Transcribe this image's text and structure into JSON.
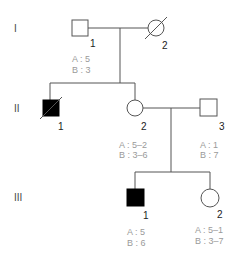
{
  "title": "",
  "generations": [
    "I",
    "II",
    "III"
  ],
  "individuals": [
    {
      "id": "I-1",
      "label": "1",
      "sex": "male",
      "affected": false,
      "deceased": false,
      "genotype": {
        "A": "A : 5",
        "B": "B : 3"
      }
    },
    {
      "id": "I-2",
      "label": "2",
      "sex": "female",
      "affected": false,
      "deceased": true,
      "genotype": null
    },
    {
      "id": "II-1",
      "label": "1",
      "sex": "male",
      "affected": true,
      "deceased": true,
      "genotype": null
    },
    {
      "id": "II-2",
      "label": "2",
      "sex": "female",
      "affected": false,
      "deceased": false,
      "genotype": {
        "A": "A : 5–2",
        "B": "B : 3–6"
      }
    },
    {
      "id": "II-3",
      "label": "3",
      "sex": "male",
      "affected": false,
      "deceased": false,
      "genotype": {
        "A": "A : 1",
        "B": "B : 7"
      }
    },
    {
      "id": "III-1",
      "label": "1",
      "sex": "male",
      "affected": true,
      "deceased": false,
      "genotype": {
        "A": "A : 5",
        "B": "B : 6"
      }
    },
    {
      "id": "III-2",
      "label": "2",
      "sex": "female",
      "affected": false,
      "deceased": false,
      "genotype": {
        "A": "A : 5–1",
        "B": "B : 3–7"
      }
    }
  ],
  "colors": {
    "line": "#555555",
    "affected": "#000000",
    "genotype_text": "#9a9a9a"
  }
}
